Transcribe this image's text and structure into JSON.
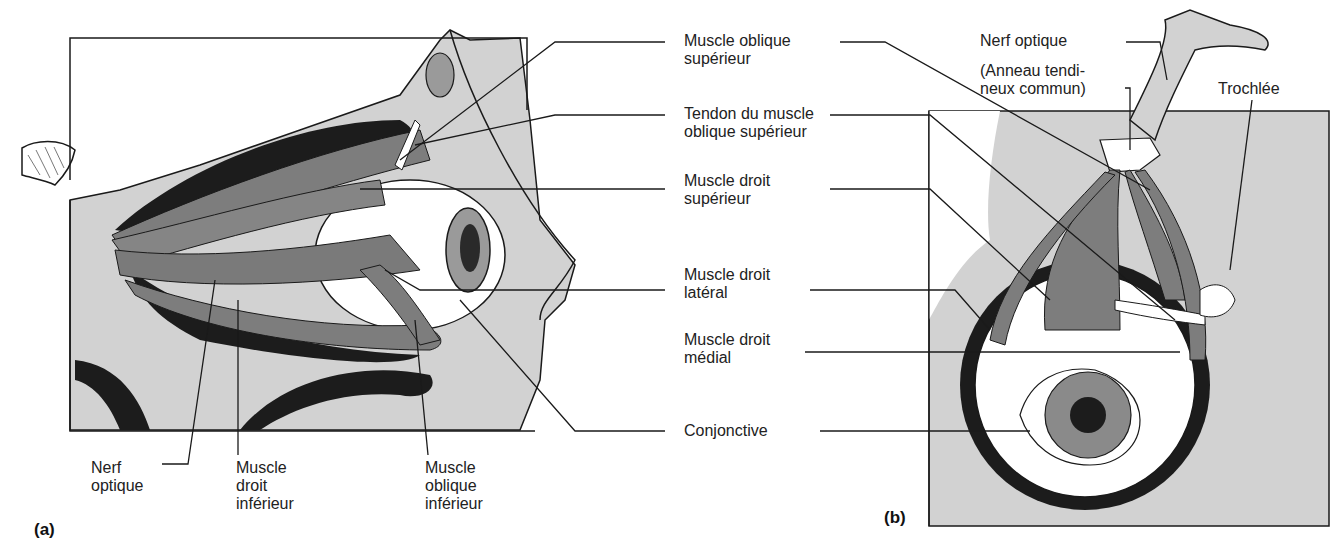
{
  "figure": {
    "panels": [
      {
        "id": "a",
        "tag": "(a)",
        "view": "lateral",
        "labels_right": [
          {
            "line1": "Muscle oblique",
            "line2": "supérieur"
          },
          {
            "line1": "Tendon du muscle",
            "line2": "oblique supérieur"
          },
          {
            "line1": "Muscle droit",
            "line2": "supérieur"
          },
          {
            "line1": "Muscle droit",
            "line2": "latéral"
          },
          {
            "line1": "Muscle droit",
            "line2": "médial"
          },
          {
            "line1": "Conjonctive",
            "line2": ""
          }
        ],
        "labels_bottom": [
          {
            "line1": "Nerf",
            "line2": "optique",
            "line3": ""
          },
          {
            "line1": "Muscle",
            "line2": "droit",
            "line3": "inférieur"
          },
          {
            "line1": "Muscle",
            "line2": "oblique",
            "line3": "inférieur"
          }
        ]
      },
      {
        "id": "b",
        "tag": "(b)",
        "view": "superior",
        "labels_top": [
          {
            "line1": "Nerf optique",
            "line2": ""
          },
          {
            "line1": "(Anneau tendi-",
            "line2": "neux commun)"
          },
          {
            "line1": "Trochlée",
            "line2": ""
          }
        ]
      }
    ],
    "colors": {
      "background": "#ffffff",
      "bone_fill": "#d2d2d2",
      "muscle": "#7d7d7d",
      "shadow": "#1c1c1c",
      "sclera": "#ffffff",
      "leader_line": "#1a1a1a"
    }
  }
}
